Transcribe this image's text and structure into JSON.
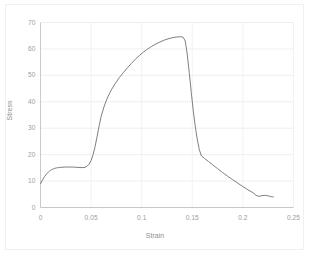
{
  "chart_data": {
    "type": "line",
    "title": "",
    "xlabel": "Strain",
    "ylabel": "Stress",
    "xlim": [
      0,
      0.25
    ],
    "ylim": [
      0,
      70
    ],
    "grid": true,
    "legend": "none",
    "x_ticks": [
      "0",
      "0.05",
      "0.1",
      "0.15",
      "0.2",
      "0.25"
    ],
    "x_tick_values": [
      0,
      0.05,
      0.1,
      0.15,
      0.2,
      0.25
    ],
    "y_ticks": [
      "0",
      "10",
      "20",
      "30",
      "40",
      "50",
      "60",
      "70"
    ],
    "y_tick_values": [
      0,
      10,
      20,
      30,
      40,
      50,
      60,
      70
    ],
    "line_color": "#7f7f7f",
    "line_width": 1,
    "series": [
      {
        "name": "Stress vs Strain",
        "x": [
          0.0,
          0.002,
          0.004,
          0.006,
          0.008,
          0.01,
          0.012,
          0.014,
          0.016,
          0.018,
          0.02,
          0.024,
          0.028,
          0.032,
          0.036,
          0.04,
          0.042,
          0.044,
          0.046,
          0.048,
          0.05,
          0.052,
          0.054,
          0.056,
          0.058,
          0.06,
          0.063,
          0.066,
          0.07,
          0.074,
          0.078,
          0.082,
          0.086,
          0.09,
          0.094,
          0.098,
          0.102,
          0.106,
          0.11,
          0.114,
          0.118,
          0.122,
          0.126,
          0.13,
          0.134,
          0.137,
          0.139,
          0.141,
          0.143,
          0.145,
          0.147,
          0.149,
          0.151,
          0.153,
          0.155,
          0.157,
          0.159,
          0.162,
          0.166,
          0.17,
          0.175,
          0.18,
          0.185,
          0.19,
          0.195,
          0.2,
          0.205,
          0.21,
          0.213,
          0.216,
          0.219,
          0.222,
          0.225,
          0.228,
          0.23
        ],
        "y": [
          9.0,
          10.4,
          11.7,
          12.7,
          13.5,
          14.1,
          14.5,
          14.8,
          15.0,
          15.1,
          15.2,
          15.3,
          15.3,
          15.3,
          15.2,
          15.1,
          15.1,
          15.2,
          15.6,
          16.4,
          17.8,
          20.0,
          23.2,
          27.0,
          31.0,
          34.6,
          38.4,
          41.4,
          44.5,
          47.0,
          49.2,
          51.1,
          52.9,
          54.6,
          56.2,
          57.6,
          58.9,
          60.0,
          61.0,
          61.9,
          62.6,
          63.3,
          63.8,
          64.2,
          64.5,
          64.6,
          64.6,
          64.4,
          63.0,
          58.0,
          51.0,
          43.5,
          36.5,
          30.5,
          25.5,
          21.8,
          19.5,
          18.6,
          17.4,
          16.2,
          14.7,
          13.2,
          11.8,
          10.5,
          9.2,
          7.9,
          6.7,
          5.6,
          4.6,
          4.2,
          4.5,
          4.6,
          4.4,
          4.1,
          4.0
        ]
      }
    ]
  },
  "axis": {
    "y_title": "Stress",
    "x_title": "Strain"
  }
}
